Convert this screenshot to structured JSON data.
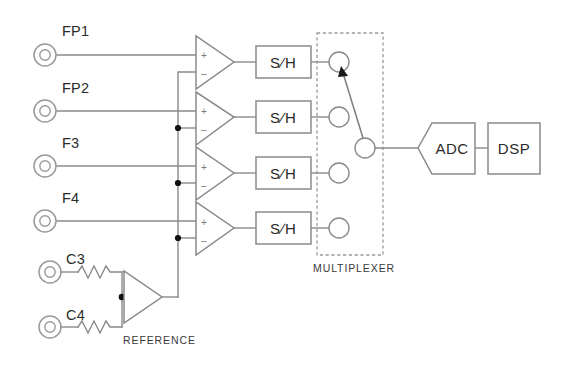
{
  "diagram": {
    "background_color": "#ffffff",
    "line_color": "#8a8a8a",
    "text_color": "#2b2b2b",
    "electrodes": [
      {
        "label": "FP1",
        "icon": "electrode-icon"
      },
      {
        "label": "FP2",
        "icon": "electrode-icon"
      },
      {
        "label": "F3",
        "icon": "electrode-icon"
      },
      {
        "label": "F4",
        "icon": "electrode-icon"
      },
      {
        "label": "C3",
        "icon": "electrode-icon"
      },
      {
        "label": "C4",
        "icon": "electrode-icon"
      }
    ],
    "amplifiers": [
      {
        "name": "amplifier-1",
        "plus": "+",
        "minus": "–"
      },
      {
        "name": "amplifier-2",
        "plus": "+",
        "minus": "–"
      },
      {
        "name": "amplifier-3",
        "plus": "+",
        "minus": "–"
      },
      {
        "name": "amplifier-4",
        "plus": "+",
        "minus": "–"
      }
    ],
    "sample_hold_blocks": [
      {
        "label": "S∕H"
      },
      {
        "label": "S∕H"
      },
      {
        "label": "S∕H"
      },
      {
        "label": "S∕H"
      }
    ],
    "multiplexer": {
      "caption": "MULTIPLEXER",
      "input_count": 4,
      "output_count": 1,
      "selected_input_index": 0
    },
    "reference": {
      "caption": "REFERENCE",
      "resistor_count": 2
    },
    "blocks": [
      {
        "label": "ADC",
        "shape": "pentagon-flag"
      },
      {
        "label": "DSP",
        "shape": "rectangle"
      }
    ]
  }
}
